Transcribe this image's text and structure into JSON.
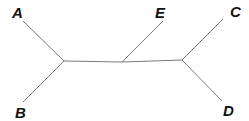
{
  "diagram": {
    "type": "unrooted-phylogenetic-tree",
    "line_color": "#7a7a7a",
    "label_color": "#111111",
    "internal_nodes": [
      {
        "id": "n1",
        "x": 64,
        "y": 61
      },
      {
        "id": "n2",
        "x": 122,
        "y": 62
      },
      {
        "id": "n3",
        "x": 182,
        "y": 60
      }
    ],
    "leaves": [
      {
        "label": "A",
        "x": 23,
        "y": 21,
        "label_x": 12,
        "label_y": 18,
        "parent": "n1"
      },
      {
        "label": "B",
        "x": 23,
        "y": 102,
        "label_x": 15,
        "label_y": 118,
        "parent": "n1"
      },
      {
        "label": "E",
        "x": 163,
        "y": 21,
        "label_x": 155,
        "label_y": 18,
        "parent": "n2"
      },
      {
        "label": "C",
        "x": 223,
        "y": 19,
        "label_x": 230,
        "label_y": 17,
        "parent": "n3"
      },
      {
        "label": "D",
        "x": 222,
        "y": 101,
        "label_x": 223,
        "label_y": 116,
        "parent": "n3"
      }
    ],
    "internal_edges": [
      {
        "from": "n1",
        "to": "n2"
      },
      {
        "from": "n2",
        "to": "n3"
      }
    ]
  }
}
